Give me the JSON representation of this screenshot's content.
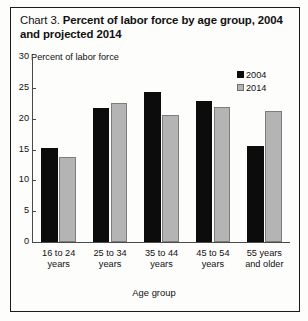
{
  "figure": {
    "caption_prefix": "Chart 3.",
    "caption_main": "Percent of labor force by age group, 2004 and projected 2014"
  },
  "chart_data": {
    "type": "bar",
    "title": "Percent of labor force by age group, 2004 and projected 2014",
    "xlabel": "Age group",
    "ylabel": "Percent of labor force",
    "ylim": [
      0,
      30
    ],
    "yticks": [
      0,
      5,
      10,
      15,
      20,
      25,
      30
    ],
    "grid": false,
    "legend_position": "top-right",
    "categories": [
      "16 to 24 years",
      "25 to 34 years",
      "35 to 44 years",
      "45 to 54 years",
      "55 years and older"
    ],
    "category_lines": [
      [
        "16 to 24",
        "years"
      ],
      [
        "25 to 34",
        "years"
      ],
      [
        "35 to 44",
        "years"
      ],
      [
        "45 to 54",
        "years"
      ],
      [
        "55 years",
        "and older"
      ]
    ],
    "series": [
      {
        "name": "2004",
        "color": "#0c0c0c",
        "values": [
          15.2,
          21.8,
          24.3,
          22.9,
          15.6
        ]
      },
      {
        "name": "2014",
        "color": "#b4b4b4",
        "values": [
          13.8,
          22.5,
          20.6,
          21.9,
          21.2
        ]
      }
    ]
  }
}
